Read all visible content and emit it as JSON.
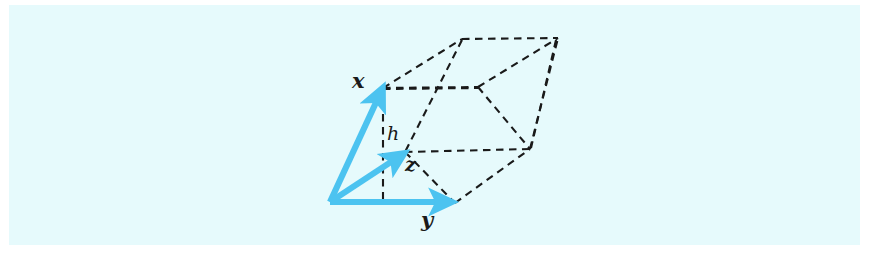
{
  "figure": {
    "background_color": "#e6fafc",
    "page_color": "#ffffff",
    "vector_color": "#4cc3f0",
    "line_color": "#1a1a1a",
    "labels": {
      "x": "x",
      "y": "y",
      "z": "z",
      "h": "h"
    },
    "vectors": [
      {
        "name": "x",
        "from": [
          330,
          203
        ],
        "to": [
          383,
          88
        ],
        "label": "x"
      },
      {
        "name": "y",
        "from": [
          330,
          203
        ],
        "to": [
          455,
          203
        ],
        "label": "y"
      },
      {
        "name": "z",
        "from": [
          330,
          203
        ],
        "to": [
          405,
          153
        ],
        "label": "z"
      }
    ],
    "height_segment": {
      "name": "h",
      "from": [
        383,
        88
      ],
      "to": [
        383,
        200
      ],
      "label": "h",
      "style": "dashed"
    },
    "solid_edges_style": "dashed",
    "vertices": {
      "origin": [
        330,
        203
      ],
      "x_tip": [
        383,
        88
      ],
      "y_tip": [
        455,
        203
      ],
      "z_tip": [
        405,
        153
      ],
      "top_back_left": [
        462,
        39
      ],
      "top_back_right": [
        558,
        38
      ],
      "mid_right": [
        530,
        147
      ],
      "front_right_bottom": [
        530,
        147
      ]
    }
  }
}
